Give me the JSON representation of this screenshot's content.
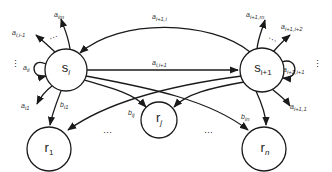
{
  "diagram": {
    "type": "state-transition-graph",
    "nodes": [
      {
        "id": "s_i",
        "label": "s",
        "sub": "i",
        "x": 66,
        "y": 70,
        "r": 21
      },
      {
        "id": "s_i1",
        "label": "s",
        "sub": "i+1",
        "x": 262,
        "y": 70,
        "r": 22
      },
      {
        "id": "r_1",
        "label": "r",
        "sub": "1",
        "x": 49,
        "y": 149,
        "r": 22
      },
      {
        "id": "r_j",
        "label": "r",
        "sub": "j",
        "x": 159,
        "y": 120,
        "r": 18
      },
      {
        "id": "r_n",
        "label": "r",
        "sub": "n",
        "x": 264,
        "y": 149,
        "r": 22
      }
    ],
    "edge_labels": {
      "a_im": "a",
      "a_im_sub": "im",
      "a_i_l1": "a",
      "a_i_l1_sub": "i,i-1",
      "a_ii": "a",
      "a_ii_sub": "ii",
      "a_i1": "a",
      "a_i1_sub": "i1",
      "b_i1": "b",
      "b_i1_sub": "i1",
      "b_ij": "b",
      "b_ij_sub": "ij",
      "a_i1_i": "a",
      "a_i1_i_sub": "i+1,i",
      "a_i_i1": "a",
      "a_i_i1_sub": "i,i+1",
      "a_i1_m": "a",
      "a_i1_m_sub": "i+1,m",
      "a_i1_i2": "a",
      "a_i1_i2_sub": "i+1,i+2",
      "a_i1_i1": "a",
      "a_i1_i1_sub": "i+1,i+1",
      "a_i1_1": "a",
      "a_i1_1_sub": "i+1,1",
      "b_in": "b",
      "b_in_sub": "in"
    },
    "ellipses": {
      "h": "···",
      "v": "⋮"
    }
  }
}
